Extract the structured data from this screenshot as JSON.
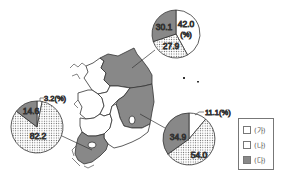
{
  "title": "",
  "legend": {
    "items": [
      {
        "label": "(가)",
        "pattern": "white"
      },
      {
        "label": "(나)",
        "pattern": "dotted"
      },
      {
        "label": "(다)",
        "pattern": "gray"
      }
    ]
  },
  "colors": {
    "region_highlight": "#888888",
    "pie_gray": "#888888",
    "outline": "#333333"
  },
  "pies": {
    "northeast": {
      "values": {
        "ga": 42.0,
        "na": 27.9,
        "da": 30.1
      },
      "labels": {
        "ga": "42.0",
        "ga_unit": "(%)",
        "na": "27.9",
        "da": "30.1"
      }
    },
    "southwest": {
      "values": {
        "ga": 3.2,
        "na": 82.2,
        "da": 14.6
      },
      "labels": {
        "ga": "3.2(%)",
        "na": "82.2",
        "da": "14.6"
      }
    },
    "southeast": {
      "values": {
        "ga": 11.1,
        "na": 54.0,
        "da": 34.9
      },
      "labels": {
        "ga": "11.1(%)",
        "na": "54.0",
        "da": "34.9"
      }
    }
  },
  "map": {
    "highlighted_regions": [
      "Gangwon",
      "Gyeongbuk",
      "Jeonnam"
    ]
  }
}
